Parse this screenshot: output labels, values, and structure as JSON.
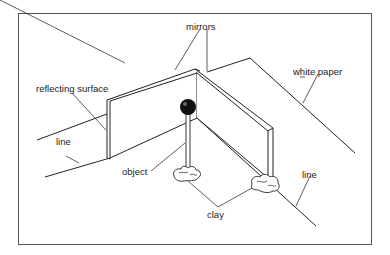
{
  "figure": {
    "type": "experimental-setup-illustration",
    "colors": {
      "ink": "#222222",
      "background": "#ffffff",
      "frame": "#555555",
      "ball": "#111111"
    }
  },
  "labels": {
    "mirrors": "mirrors",
    "reflecting_surface": "reflecting surface",
    "white_paper": "white paper",
    "line_left": "line",
    "line_right": "line",
    "object": "object",
    "clay": "clay"
  }
}
